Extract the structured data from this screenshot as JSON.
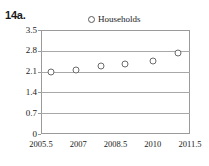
{
  "figure": {
    "label": "14a."
  },
  "legend": {
    "entries": [
      {
        "label": "Households",
        "marker": "open-circle"
      }
    ],
    "position": "top-center"
  },
  "chart_data": {
    "type": "scatter",
    "title": "",
    "subtitle": "",
    "xlabel": "",
    "ylabel": "",
    "xlim": [
      2005.5,
      2011.5
    ],
    "ylim": [
      0,
      3.5
    ],
    "grid": true,
    "legend_position": "top-center",
    "xticks": [
      2005.5,
      2007,
      2008.5,
      2010,
      2011.5
    ],
    "xtick_labels": [
      "2005.5",
      "2007",
      "2008.5",
      "2010",
      "2011.5"
    ],
    "yticks": [
      0,
      0.7,
      1.4,
      2.1,
      2.8,
      3.5
    ],
    "ytick_labels": [
      "0",
      "0.7",
      "1.4",
      "2.1",
      "2.8",
      "3.5"
    ],
    "series": [
      {
        "name": "Households",
        "marker": "open-circle",
        "color": "#6b6b6b",
        "x": [
          2005.9,
          2006.9,
          2007.9,
          2008.9,
          2010.0,
          2011.0
        ],
        "values": [
          2.09,
          2.15,
          2.29,
          2.36,
          2.46,
          2.73
        ]
      }
    ]
  }
}
